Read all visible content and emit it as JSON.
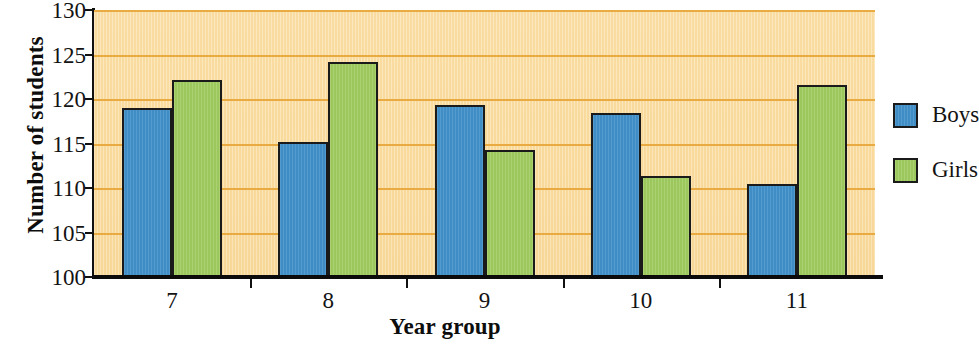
{
  "chart_data": {
    "type": "bar",
    "title": "",
    "xlabel": "Year group",
    "ylabel": "Number of students",
    "categories": [
      "7",
      "8",
      "9",
      "10",
      "11"
    ],
    "series": [
      {
        "name": "Boys",
        "color": "#4190c9",
        "values": [
          119.0,
          115.2,
          119.3,
          118.4,
          110.5
        ]
      },
      {
        "name": "Girls",
        "color": "#9fcb5f",
        "values": [
          122.1,
          124.2,
          114.3,
          111.4,
          121.6
        ]
      }
    ],
    "ylim": [
      100,
      130
    ],
    "y_ticks": [
      100,
      105,
      110,
      115,
      120,
      125,
      130
    ],
    "y_ticklabels": [
      "100",
      "105",
      "110",
      "115",
      "120",
      "125",
      "130"
    ],
    "grid": true,
    "grid_color": "#e8a93c",
    "plot_background": "#fbe0a8",
    "legend_position": "right"
  },
  "legend": {
    "entries": [
      {
        "label": "Boys"
      },
      {
        "label": "Girls"
      }
    ]
  }
}
